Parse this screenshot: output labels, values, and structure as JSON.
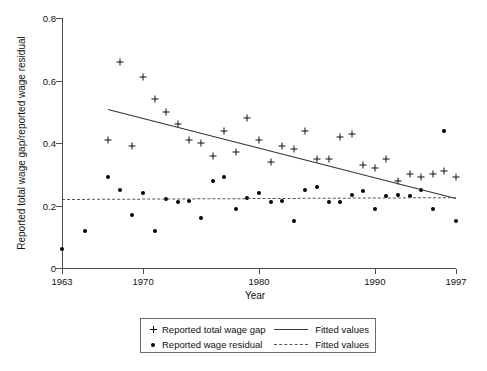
{
  "chart_data": {
    "type": "scatter",
    "title": "",
    "xlabel": "Year",
    "ylabel": "Reported total wage gap/reported wage residual",
    "xlim": [
      1963,
      1997
    ],
    "ylim": [
      0,
      0.8
    ],
    "xticks": [
      1963,
      1970,
      1980,
      1990,
      1997
    ],
    "xticklabels": [
      "1963",
      "1970",
      "1980",
      "1990",
      "1997"
    ],
    "yticks": [
      0,
      0.2,
      0.4,
      0.6,
      0.8
    ],
    "yticklabels": [
      "0",
      "0.2",
      "0.4",
      "0.6",
      "0.8"
    ],
    "grid": false,
    "legend_position": "below-axes",
    "series": [
      {
        "name": "Reported total wage gap",
        "marker": "plus",
        "x": [
          1967,
          1968,
          1969,
          1970,
          1971,
          1972,
          1973,
          1974,
          1975,
          1976,
          1977,
          1978,
          1979,
          1980,
          1981,
          1982,
          1983,
          1984,
          1985,
          1986,
          1987,
          1988,
          1989,
          1990,
          1991,
          1992,
          1993,
          1994,
          1995,
          1996,
          1997
        ],
        "y": [
          0.41,
          0.66,
          0.39,
          0.61,
          0.54,
          0.5,
          0.46,
          0.41,
          0.4,
          0.36,
          0.44,
          0.37,
          0.48,
          0.41,
          0.34,
          0.39,
          0.38,
          0.44,
          0.35,
          0.35,
          0.42,
          0.43,
          0.33,
          0.32,
          0.35,
          0.28,
          0.3,
          0.29,
          0.3,
          0.31,
          0.29
        ]
      },
      {
        "name": "Reported wage residual",
        "marker": "dot",
        "x": [
          1963,
          1965,
          1967,
          1968,
          1969,
          1970,
          1971,
          1972,
          1973,
          1974,
          1975,
          1976,
          1977,
          1978,
          1979,
          1980,
          1981,
          1982,
          1983,
          1984,
          1985,
          1986,
          1987,
          1988,
          1989,
          1990,
          1991,
          1992,
          1993,
          1994,
          1995,
          1996,
          1997
        ],
        "y": [
          0.06,
          0.12,
          0.29,
          0.25,
          0.17,
          0.24,
          0.12,
          0.22,
          0.21,
          0.215,
          0.16,
          0.28,
          0.29,
          0.19,
          0.225,
          0.24,
          0.21,
          0.215,
          0.15,
          0.25,
          0.26,
          0.21,
          0.21,
          0.235,
          0.245,
          0.19,
          0.23,
          0.235,
          0.23,
          0.25,
          0.19,
          0.44,
          0.15
        ]
      }
    ],
    "fits": [
      {
        "name": "Fitted values",
        "style": "solid",
        "for_series": "Reported total wage gap",
        "x_start": 1967,
        "y_start": 0.51,
        "x_end": 1997,
        "y_end": 0.225
      },
      {
        "name": "Fitted values",
        "style": "dashed",
        "for_series": "Reported wage residual",
        "x_start": 1963,
        "y_start": 0.222,
        "x_end": 1997,
        "y_end": 0.228
      }
    ]
  },
  "legend": {
    "entries": [
      {
        "marker": "plus",
        "label": "Reported total wage gap",
        "fit_style": "solid",
        "fit_label": "Fitted values"
      },
      {
        "marker": "dot",
        "label": "Reported wage residual",
        "fit_style": "dashed",
        "fit_label": "Fitted values"
      }
    ]
  }
}
